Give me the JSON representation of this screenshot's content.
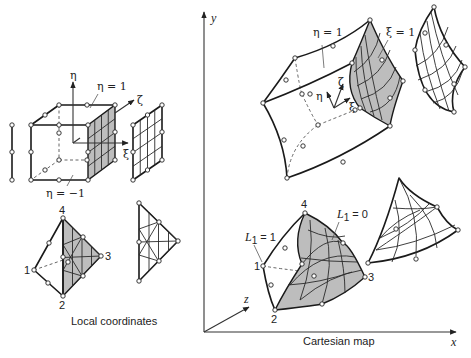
{
  "figure": {
    "left_panel": {
      "caption": "Local coordinates",
      "cube_labels": {
        "eta_axis": "η",
        "zeta_axis": "ζ",
        "xi_axis": "ξ",
        "eta_top_face": "η = 1",
        "eta_bottom_face": "η = −1"
      },
      "tet_node_labels": [
        "1",
        "2",
        "3",
        "4"
      ]
    },
    "right_panel": {
      "caption": "Cartesian map",
      "axes": {
        "x": "x",
        "y": "y",
        "z": "z"
      },
      "hex_labels": {
        "eta_face": "η = 1",
        "xi_face": "ξ = 1",
        "eta_axis": "η",
        "zeta_axis": "ζ",
        "xi_axis": "ξ"
      },
      "tet_labels": {
        "L1_eq_1": "L",
        "L1_eq_1_sub": "1",
        "L1_eq_1_rest": " = 1",
        "L1_eq_0": "L",
        "L1_eq_0_sub": "1",
        "L1_eq_0_rest": " = 0",
        "node_labels": [
          "1",
          "2",
          "3",
          "4"
        ]
      }
    },
    "colors": {
      "shade": "#bdbdbd",
      "line": "#1a1a1a",
      "background": "#ffffff"
    }
  }
}
